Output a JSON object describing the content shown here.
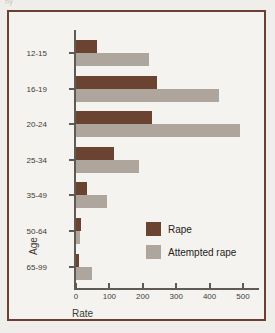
{
  "top_artifact": "ny",
  "chart_data": {
    "type": "bar",
    "orientation": "horizontal",
    "title": "",
    "xlabel": "Rate",
    "ylabel": "Age",
    "categories": [
      "12-15",
      "16-19",
      "20-24",
      "25-34",
      "35-49",
      "65-99",
      "50-64"
    ],
    "category_order": [
      "12-15",
      "16-19",
      "20-24",
      "25-34",
      "35-49",
      "50-64",
      "65-99"
    ],
    "series": [
      {
        "name": "Rape",
        "color": "#6b4331",
        "values": [
          62,
          242,
          227,
          113,
          33,
          8,
          14
        ]
      },
      {
        "name": "Attempted rape",
        "color": "#aea59c",
        "values": [
          218,
          428,
          490,
          190,
          93,
          47,
          12
        ]
      }
    ],
    "xticks": [
      0,
      100,
      200,
      300,
      400,
      500
    ],
    "xlim": [
      0,
      530
    ],
    "grid": false,
    "legend_position": "inside-right-lower",
    "legend": [
      "Rape",
      "Attempted rape"
    ]
  },
  "colors": {
    "frame": "#6a4130",
    "axis": "#5f5a54",
    "rape": "#6b4331",
    "attempted": "#aea59c",
    "page_background": "#efeeea",
    "plot_background": "#f5f3ef",
    "text": "#3f3b37"
  }
}
